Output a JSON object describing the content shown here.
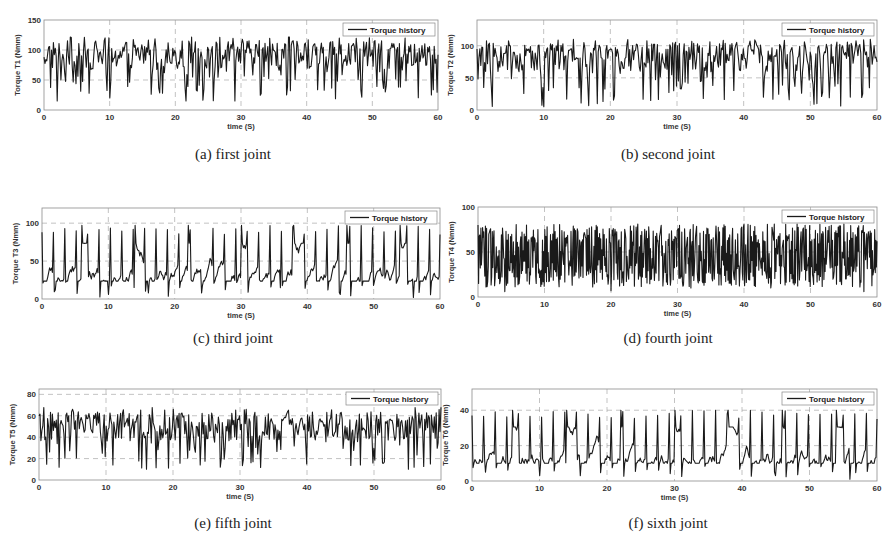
{
  "figure": {
    "legend_label": "Torque history",
    "xlabel": "time (S)",
    "line_color": "#1a1a1a",
    "grid_color": "#9a9a9a",
    "frame_color": "#8c8c8c"
  },
  "chart_data": [
    {
      "id": "a",
      "type": "line",
      "caption": "(a) first joint",
      "title": "",
      "xlabel": "time (S)",
      "ylabel": "Torque T1 (Nmm)",
      "xlim": [
        0,
        60
      ],
      "ylim": [
        0,
        150
      ],
      "xticks": [
        0,
        10,
        20,
        30,
        40,
        50,
        60
      ],
      "yticks": [
        0,
        50,
        100,
        150
      ],
      "grid": true,
      "legend": [
        "Torque history"
      ],
      "legend_position": "upper right",
      "series": [
        {
          "name": "Torque history",
          "mean": 90,
          "min": 15,
          "max": 122,
          "description": "dense oscillation around ~90 Nmm with frequent downward spikes to 15-50"
        }
      ],
      "sample_points": {
        "x": [
          0,
          2,
          5,
          10,
          15,
          18,
          20,
          25,
          29,
          30,
          35,
          37,
          40,
          45,
          50,
          52,
          55,
          59,
          60
        ],
        "y": [
          88,
          15,
          90,
          20,
          100,
          28,
          95,
          100,
          14,
          110,
          100,
          25,
          95,
          120,
          100,
          30,
          120,
          25,
          92
        ]
      },
      "frame": {
        "left": 44,
        "top": 20,
        "right": 438,
        "bottom": 110
      },
      "caption_pos": {
        "x": 233,
        "y": 146
      }
    },
    {
      "id": "b",
      "type": "line",
      "caption": "(b) second joint",
      "title": "",
      "xlabel": "time (S)",
      "ylabel": "Torque T2 (Nmm)",
      "xlim": [
        0,
        60
      ],
      "ylim": [
        0,
        140
      ],
      "xticks": [
        0,
        10,
        20,
        30,
        40,
        50,
        60
      ],
      "yticks": [
        0,
        50,
        100
      ],
      "grid": true,
      "legend": [
        "Torque history"
      ],
      "legend_position": "upper right",
      "series": [
        {
          "name": "Torque history",
          "mean": 80,
          "min": 5,
          "max": 110,
          "description": "oscillation around ~80 Nmm, deep spikes down to 5-40"
        }
      ],
      "sample_points": {
        "x": [
          0,
          1,
          5,
          10,
          15,
          18,
          20,
          26,
          30,
          34,
          40,
          43,
          50,
          51,
          56,
          59,
          60
        ],
        "y": [
          95,
          35,
          100,
          5,
          80,
          10,
          95,
          15,
          100,
          18,
          95,
          20,
          90,
          10,
          20,
          110,
          75
        ]
      },
      "frame": {
        "left": 477,
        "top": 20,
        "right": 877,
        "bottom": 110
      },
      "caption_pos": {
        "x": 668,
        "y": 146
      }
    },
    {
      "id": "c",
      "type": "line",
      "caption": "(c) third joint",
      "title": "",
      "xlabel": "time (S)",
      "ylabel": "Torque T3 (Nmm)",
      "xlim": [
        0,
        60
      ],
      "ylim": [
        0,
        120
      ],
      "xticks": [
        0,
        10,
        20,
        30,
        40,
        50,
        60
      ],
      "yticks": [
        0,
        50,
        100
      ],
      "grid": true,
      "legend": [
        "Torque history"
      ],
      "legend_position": "upper right",
      "series": [
        {
          "name": "Torque history",
          "mean": 50,
          "min": 2,
          "max": 97,
          "description": "oscillation around ~50 Nmm with sharp peaks to ~95 and dips to ~5"
        }
      ],
      "sample_points": {
        "x": [
          0,
          2,
          6,
          10,
          14,
          16,
          22,
          24,
          30,
          36,
          38,
          45,
          46,
          54,
          56,
          60
        ],
        "y": [
          88,
          12,
          97,
          6,
          97,
          8,
          97,
          8,
          97,
          15,
          97,
          6,
          97,
          97,
          2,
          85
        ]
      },
      "frame": {
        "left": 42,
        "top": 208,
        "right": 440,
        "bottom": 299
      },
      "caption_pos": {
        "x": 233,
        "y": 330
      }
    },
    {
      "id": "d",
      "type": "line",
      "caption": "(d) fourth joint",
      "title": "",
      "xlabel": "time (S)",
      "ylabel": "Torque T4 (Nmm)",
      "xlim": [
        0,
        60
      ],
      "ylim": [
        0,
        100
      ],
      "xticks": [
        0,
        10,
        20,
        30,
        40,
        50,
        60
      ],
      "yticks": [
        0,
        50,
        100
      ],
      "grid": true,
      "legend": [
        "Torque history"
      ],
      "legend_position": "upper right",
      "series": [
        {
          "name": "Torque history",
          "mean": 45,
          "min": 6,
          "max": 81,
          "description": "very dense high-frequency oscillation between ~10 and ~80 Nmm"
        }
      ],
      "sample_points": {
        "x": [
          0,
          4,
          10,
          20,
          24,
          30,
          32,
          40,
          44,
          48,
          55,
          58,
          60
        ],
        "y": [
          80,
          6,
          75,
          7,
          81,
          75,
          10,
          81,
          10,
          81,
          81,
          6,
          62
        ]
      },
      "frame": {
        "left": 478,
        "top": 207,
        "right": 877,
        "bottom": 297
      },
      "caption_pos": {
        "x": 668,
        "y": 330
      }
    },
    {
      "id": "e",
      "type": "line",
      "caption": "(e) fifth joint",
      "title": "",
      "xlabel": "time (S)",
      "ylabel": "Torque T5 (Nmm)",
      "xlim": [
        0,
        60
      ],
      "ylim": [
        0,
        85
      ],
      "xticks": [
        0,
        10,
        20,
        30,
        40,
        50,
        60
      ],
      "yticks": [
        0,
        20,
        40,
        60,
        80
      ],
      "grid": true,
      "legend": [
        "Torque history"
      ],
      "legend_position": "upper right",
      "series": [
        {
          "name": "Torque history",
          "mean": 48,
          "min": 10,
          "max": 68,
          "description": "oscillation around ~50 Nmm, peaks ~65, dips down to ~10-20"
        }
      ],
      "sample_points": {
        "x": [
          0,
          3,
          5,
          11,
          16,
          20,
          24,
          27,
          32,
          40,
          48,
          56,
          60
        ],
        "y": [
          60,
          12,
          66,
          14,
          10,
          66,
          14,
          12,
          17,
          15,
          14,
          12,
          68
        ]
      },
      "frame": {
        "left": 39,
        "top": 389,
        "right": 441,
        "bottom": 480
      },
      "caption_pos": {
        "x": 233,
        "y": 515
      }
    },
    {
      "id": "f",
      "type": "line",
      "caption": "(f) sixth joint",
      "title": "",
      "xlabel": "time (S)",
      "ylabel": "Torque T6 (Nmm)",
      "xlim": [
        0,
        60
      ],
      "ylim": [
        0,
        52
      ],
      "xticks": [
        0,
        10,
        20,
        30,
        40,
        50,
        60
      ],
      "yticks": [
        0,
        20,
        40
      ],
      "grid": true,
      "legend": [
        "Torque history"
      ],
      "legend_position": "upper right",
      "series": [
        {
          "name": "Torque history",
          "mean": 21,
          "min": 1,
          "max": 40,
          "description": "oscillation around ~21 Nmm with peaks to ~40 and dips to ~2"
        }
      ],
      "sample_points": {
        "x": [
          0,
          2,
          6,
          10,
          14,
          16,
          22,
          30,
          38,
          45,
          46,
          54,
          56,
          60
        ],
        "y": [
          37,
          5,
          40,
          3,
          40,
          3,
          40,
          40,
          40,
          3,
          40,
          40,
          1,
          35
        ]
      },
      "frame": {
        "left": 472,
        "top": 389,
        "right": 877,
        "bottom": 481
      },
      "caption_pos": {
        "x": 668,
        "y": 515
      }
    }
  ]
}
